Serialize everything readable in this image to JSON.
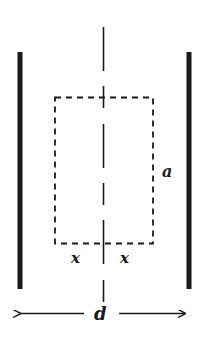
{
  "diagram": {
    "labels": {
      "height": "a",
      "half_width_left": "x",
      "half_width_right": "x",
      "separation": "d"
    },
    "colors": {
      "ink": "#1a1a1a",
      "background": "#ffffff"
    }
  }
}
